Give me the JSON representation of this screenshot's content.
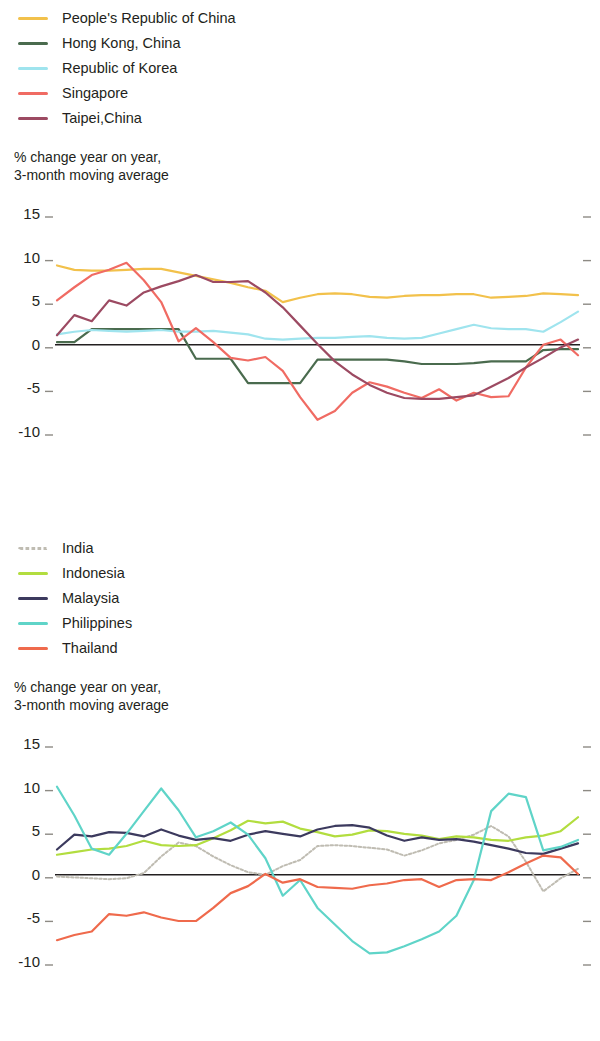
{
  "chart_data": [
    {
      "type": "line",
      "title": "",
      "subtitle": "",
      "ylabel": "% change year on year,\n3-month moving average",
      "xlabel": "",
      "ylim": [
        -10,
        15
      ],
      "yticks": [
        15,
        10,
        5,
        0,
        -5,
        -10
      ],
      "ytick_labels": [
        "15",
        "10",
        "5",
        "0",
        "-5",
        "-10"
      ],
      "grid": false,
      "legend_position": "above-left",
      "x": [
        "Jan 2014",
        "Feb 2014",
        "Mar 2014",
        "Apr 2014",
        "May 2014",
        "Jun 2014",
        "Jul 2014",
        "Aug 2014",
        "Sep 2014",
        "Oct 2014",
        "Nov 2014",
        "Dec 2014",
        "Jan 2015",
        "Feb 2015",
        "Mar 2015",
        "Apr 2015",
        "May 2015",
        "Jun 2015",
        "Jul 2015",
        "Aug 2015",
        "Sep 2015",
        "Oct 2015",
        "Nov 2015",
        "Dec 2015",
        "Jan 2016",
        "Feb 2016",
        "Mar 2016",
        "Apr 2016",
        "May 2016",
        "Jun 2016",
        "Jul 2016"
      ],
      "xtick_labels": [
        {
          "month": "Jan",
          "year": "2014",
          "index": 0
        },
        {
          "month": "Jul",
          "year": "",
          "index": 6
        },
        {
          "month": "Jan",
          "year": "2015",
          "index": 12
        },
        {
          "month": "Jul",
          "year": "",
          "index": 18
        },
        {
          "month": "Jan",
          "year": "2016",
          "index": 24
        },
        {
          "month": "Jul",
          "year": "",
          "index": 30
        }
      ],
      "series": [
        {
          "name": "People's Republic of China",
          "color": "#f2c14b",
          "style": "solid",
          "values": [
            9.1,
            8.6,
            8.5,
            8.5,
            8.6,
            8.7,
            8.7,
            8.3,
            7.9,
            7.5,
            7.1,
            6.6,
            6.2,
            4.9,
            5.4,
            5.8,
            5.9,
            5.8,
            5.5,
            5.4,
            5.6,
            5.7,
            5.7,
            5.8,
            5.8,
            5.4,
            5.5,
            5.6,
            5.9,
            5.8,
            5.7
          ]
        },
        {
          "name": "Hong Kong, China",
          "color": "#4a6b4e",
          "style": "solid",
          "values": [
            0.3,
            0.3,
            1.8,
            1.8,
            1.8,
            1.8,
            1.8,
            1.8,
            -1.6,
            -1.6,
            -1.6,
            -4.4,
            -4.4,
            -4.4,
            -4.4,
            -1.7,
            -1.7,
            -1.7,
            -1.7,
            -1.7,
            -1.9,
            -2.2,
            -2.2,
            -2.2,
            -2.1,
            -1.9,
            -1.9,
            -1.9,
            -0.6,
            -0.5,
            -0.5
          ]
        },
        {
          "name": "Republic of Korea",
          "color": "#9fe4ee",
          "style": "solid",
          "values": [
            1.2,
            1.5,
            1.7,
            1.6,
            1.5,
            1.6,
            1.7,
            1.5,
            1.5,
            1.6,
            1.4,
            1.2,
            0.7,
            0.6,
            0.7,
            0.8,
            0.8,
            0.9,
            1.0,
            0.8,
            0.7,
            0.8,
            1.3,
            1.8,
            2.3,
            1.9,
            1.8,
            1.8,
            1.5,
            2.6,
            3.8
          ]
        },
        {
          "name": "Singapore",
          "color": "#f06b63",
          "style": "solid",
          "values": [
            5.1,
            6.6,
            8.0,
            8.6,
            9.4,
            7.4,
            4.9,
            0.4,
            1.9,
            0.3,
            -1.5,
            -1.8,
            -1.4,
            -3.0,
            -6.0,
            -8.6,
            -7.6,
            -5.5,
            -4.3,
            -4.8,
            -5.5,
            -6.1,
            -5.1,
            -6.4,
            -5.5,
            -6.0,
            -5.9,
            -2.6,
            0.0,
            0.6,
            -1.2
          ]
        },
        {
          "name": "Taipei,China",
          "color": "#9c4a62",
          "style": "solid",
          "values": [
            1.1,
            3.4,
            2.7,
            5.1,
            4.5,
            6.0,
            6.7,
            7.3,
            8.0,
            7.2,
            7.2,
            7.3,
            6.0,
            4.3,
            2.2,
            0.1,
            -1.9,
            -3.4,
            -4.6,
            -5.5,
            -6.1,
            -6.2,
            -6.2,
            -6.0,
            -5.8,
            -4.8,
            -3.8,
            -2.6,
            -1.5,
            -0.3,
            0.6
          ]
        }
      ]
    },
    {
      "type": "line",
      "title": "",
      "subtitle": "",
      "ylabel": "% change year on year,\n3-month moving average",
      "xlabel": "",
      "ylim": [
        -10,
        15
      ],
      "yticks": [
        15,
        10,
        5,
        0,
        -5,
        -10
      ],
      "ytick_labels": [
        "15",
        "10",
        "5",
        "0",
        "-5",
        "-10"
      ],
      "grid": false,
      "legend_position": "above-left",
      "x": [
        "Jan 2014",
        "Feb 2014",
        "Mar 2014",
        "Apr 2014",
        "May 2014",
        "Jun 2014",
        "Jul 2014",
        "Aug 2014",
        "Sep 2014",
        "Oct 2014",
        "Nov 2014",
        "Dec 2014",
        "Jan 2015",
        "Feb 2015",
        "Mar 2015",
        "Apr 2015",
        "May 2015",
        "Jun 2015",
        "Jul 2015",
        "Aug 2015",
        "Sep 2015",
        "Oct 2015",
        "Nov 2015",
        "Dec 2015",
        "Jan 2016",
        "Feb 2016",
        "Mar 2016",
        "Apr 2016",
        "May 2016",
        "Jun 2016",
        "Jul 2016"
      ],
      "xtick_labels": [
        {
          "month": "Jan",
          "year": "2014",
          "index": 0
        },
        {
          "month": "Jul",
          "year": "",
          "index": 6
        },
        {
          "month": "Jan",
          "year": "2015",
          "index": 12
        },
        {
          "month": "Jul",
          "year": "",
          "index": 18
        },
        {
          "month": "Jan",
          "year": "2016",
          "index": 24
        },
        {
          "month": "Jul",
          "year": "",
          "index": 30
        }
      ],
      "series": [
        {
          "name": "India",
          "color": "#bfbcb2",
          "style": "dotted",
          "values": [
            -0.2,
            -0.3,
            -0.4,
            -0.5,
            -0.4,
            0.2,
            2.1,
            3.7,
            3.3,
            2.1,
            1.1,
            0.3,
            0.0,
            1.0,
            1.7,
            3.3,
            3.4,
            3.3,
            3.1,
            2.9,
            2.2,
            2.8,
            3.6,
            4.0,
            4.6,
            5.6,
            4.4,
            1.5,
            -1.9,
            -0.4,
            0.7
          ]
        },
        {
          "name": "Indonesia",
          "color": "#b2dd3f",
          "style": "solid",
          "values": [
            2.3,
            2.6,
            2.9,
            3.0,
            3.3,
            3.9,
            3.4,
            3.3,
            3.4,
            4.2,
            5.1,
            6.2,
            5.9,
            6.1,
            5.3,
            4.9,
            4.4,
            4.6,
            5.1,
            5.0,
            4.7,
            4.5,
            4.1,
            4.4,
            4.3,
            4.0,
            3.9,
            4.3,
            4.5,
            5.0,
            6.6
          ]
        },
        {
          "name": "Malaysia",
          "color": "#3c3a5e",
          "style": "solid",
          "values": [
            2.9,
            4.6,
            4.4,
            4.9,
            4.8,
            4.4,
            5.2,
            4.5,
            4.0,
            4.2,
            3.9,
            4.6,
            5.0,
            4.7,
            4.4,
            5.2,
            5.6,
            5.7,
            5.4,
            4.5,
            3.9,
            4.3,
            4.0,
            4.1,
            3.8,
            3.4,
            3.0,
            2.5,
            2.4,
            3.0,
            3.6
          ]
        },
        {
          "name": "Philippines",
          "color": "#5fd4c8",
          "style": "solid",
          "values": [
            10.1,
            6.8,
            3.0,
            2.3,
            4.7,
            7.3,
            9.9,
            7.4,
            4.3,
            5.0,
            6.0,
            4.6,
            1.9,
            -2.4,
            -0.6,
            -3.8,
            -5.7,
            -7.6,
            -9.0,
            -8.9,
            -8.2,
            -7.4,
            -6.5,
            -4.7,
            -0.6,
            7.3,
            9.3,
            8.9,
            2.8,
            3.2,
            4.0
          ]
        },
        {
          "name": "Thailand",
          "color": "#ef6a4c",
          "style": "solid",
          "values": [
            -7.5,
            -6.9,
            -6.5,
            -4.5,
            -4.7,
            -4.3,
            -4.9,
            -5.3,
            -5.3,
            -3.8,
            -2.1,
            -1.3,
            0.1,
            -0.9,
            -0.5,
            -1.4,
            -1.5,
            -1.6,
            -1.2,
            -1.0,
            -0.6,
            -0.5,
            -1.4,
            -0.6,
            -0.5,
            -0.6,
            0.3,
            1.3,
            2.2,
            2.0,
            0.1
          ]
        }
      ]
    }
  ],
  "panels": [
    {
      "id": "top",
      "legend": [
        {
          "label": "People's Republic of China",
          "color": "#f2c14b",
          "style": "solid"
        },
        {
          "label": "Hong Kong, China",
          "color": "#4a6b4e",
          "style": "solid"
        },
        {
          "label": "Republic of Korea",
          "color": "#9fe4ee",
          "style": "solid"
        },
        {
          "label": "Singapore",
          "color": "#f06b63",
          "style": "solid"
        },
        {
          "label": "Taipei,China",
          "color": "#9c4a62",
          "style": "solid"
        }
      ],
      "axis_title": "% change year on year,\n3-month moving average"
    },
    {
      "id": "bottom",
      "legend": [
        {
          "label": "India",
          "color": "#bfbcb2",
          "style": "dotted"
        },
        {
          "label": "Indonesia",
          "color": "#b2dd3f",
          "style": "solid"
        },
        {
          "label": "Malaysia",
          "color": "#3c3a5e",
          "style": "solid"
        },
        {
          "label": "Philippines",
          "color": "#5fd4c8",
          "style": "solid"
        },
        {
          "label": "Thailand",
          "color": "#ef6a4c",
          "style": "solid"
        }
      ],
      "axis_title": "% change year on year,\n3-month moving average"
    }
  ]
}
